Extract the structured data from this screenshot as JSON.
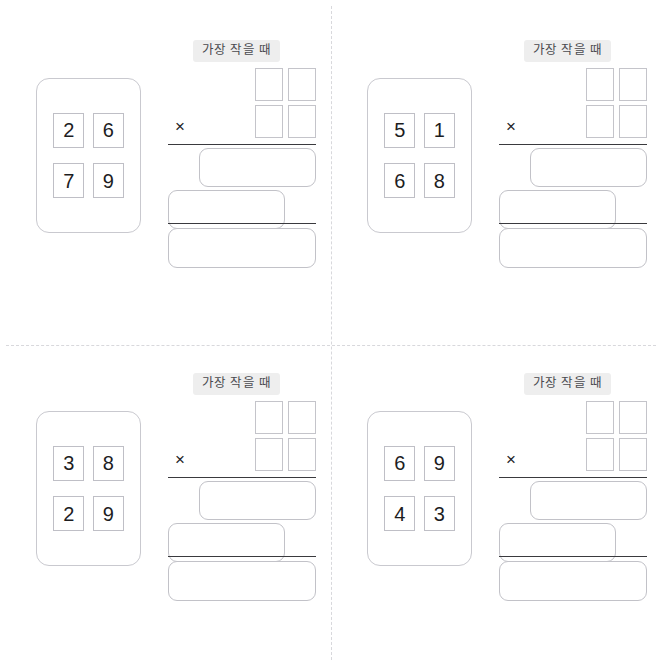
{
  "worksheet": {
    "label_smallest": "가장 작을 때",
    "times_symbol": "×",
    "panels": [
      {
        "id": "panel-1",
        "digits": [
          "2",
          "6",
          "7",
          "9"
        ],
        "label": "가장 작을 때",
        "times_symbol": "×",
        "operand_boxes": [
          "",
          "",
          "",
          ""
        ],
        "partial_product_1": "",
        "partial_product_2": "",
        "total": ""
      },
      {
        "id": "panel-2",
        "digits": [
          "5",
          "1",
          "6",
          "8"
        ],
        "label": "가장 작을 때",
        "times_symbol": "×",
        "operand_boxes": [
          "",
          "",
          "",
          ""
        ],
        "partial_product_1": "",
        "partial_product_2": "",
        "total": ""
      },
      {
        "id": "panel-3",
        "digits": [
          "3",
          "8",
          "2",
          "9"
        ],
        "label": "가장 작을 때",
        "times_symbol": "×",
        "operand_boxes": [
          "",
          "",
          "",
          ""
        ],
        "partial_product_1": "",
        "partial_product_2": "",
        "total": ""
      },
      {
        "id": "panel-4",
        "digits": [
          "6",
          "9",
          "4",
          "3"
        ],
        "label": "가장 작을 때",
        "times_symbol": "×",
        "operand_boxes": [
          "",
          "",
          "",
          ""
        ],
        "partial_product_1": "",
        "partial_product_2": "",
        "total": ""
      }
    ]
  },
  "colors": {
    "background": "#ffffff",
    "card_border": "#c9c9cf",
    "box_border": "#c2c2c8",
    "rule": "#3a3a3e",
    "label_bg": "#eeeeee",
    "label_text": "#4a4a4f",
    "digit_text": "#1d1d1f",
    "divider": "#d8d8dc"
  }
}
